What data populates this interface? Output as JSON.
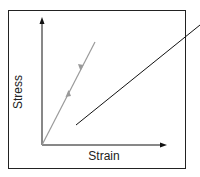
{
  "diagram": {
    "type": "stress-strain",
    "y_axis_label": "Stress",
    "x_axis_label": "Strain",
    "line_color": "#9a9a9a",
    "axis_color": "#111111",
    "leader_color": "#111111",
    "annotations": [
      "loading arrow (up)",
      "unloading arrow (down)"
    ]
  }
}
